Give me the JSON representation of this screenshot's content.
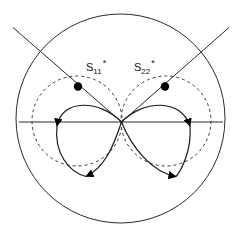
{
  "figure": {
    "name": "smith-chart-stability-diagram",
    "background_color": "#ffffff",
    "stroke_color": "#1a1a1a",
    "marker_color": "#000000",
    "width": 241,
    "height": 241
  },
  "outer_circle": {
    "name": "unit-circle",
    "cx": 120.5,
    "cy": 118.5,
    "r": 104.5,
    "style": "solid"
  },
  "center_point": {
    "x": 121.5,
    "y": 122.0
  },
  "horizontal_axis": {
    "name": "real-axis",
    "x1": 19.0,
    "y1": 122.0,
    "x2": 223.0,
    "y2": 122.0,
    "style": "solid"
  },
  "diagonals": [
    {
      "name": "left-diagonal",
      "x1": 13.0,
      "y1": 27.5,
      "x2": 121.5,
      "y2": 122.0
    },
    {
      "name": "right-diagonal",
      "x1": 229.0,
      "y1": 27.5,
      "x2": 121.5,
      "y2": 122.0
    }
  ],
  "dashed_circles": [
    {
      "name": "left-dashed-circle",
      "cx": 77.0,
      "cy": 121.0,
      "r": 45.0,
      "style": "dashed",
      "dash_pattern": "3,3"
    },
    {
      "name": "right-dashed-circle",
      "cx": 166.0,
      "cy": 121.0,
      "r": 45.0,
      "style": "dashed",
      "dash_pattern": "3,3"
    }
  ],
  "loops": [
    {
      "name": "left-loop",
      "direction": "counterclockwise",
      "outer_extent_x": 57.0,
      "bottom_y": 176.0
    },
    {
      "name": "right-loop",
      "direction": "clockwise",
      "outer_extent_x": 186.0,
      "bottom_y": 176.0
    }
  ],
  "arrowheads": [
    {
      "name": "left-loop-up-arrow",
      "x": 57.0,
      "y": 126.0,
      "rotation": -90
    },
    {
      "name": "left-loop-bottom-arrow",
      "x": 85.0,
      "y": 176.5,
      "rotation": 200
    },
    {
      "name": "right-loop-up-arrow",
      "x": 190.0,
      "y": 126.0,
      "rotation": -90
    },
    {
      "name": "right-loop-bottom-arrow",
      "x": 178.0,
      "y": 176.5,
      "rotation": -20
    }
  ],
  "markers": [
    {
      "name": "s11-conjugate-marker",
      "x": 78.0,
      "y": 86.5,
      "r": 4.2,
      "label": {
        "base": "S",
        "subscript": "11",
        "superscript": "*",
        "text": "S11*",
        "anchor_x": 86.0,
        "anchor_y": 68.0
      }
    },
    {
      "name": "s22-conjugate-marker",
      "x": 165.0,
      "y": 86.5,
      "r": 4.2,
      "label": {
        "base": "S",
        "subscript": "22",
        "superscript": "*",
        "text": "S22*",
        "anchor_x": 134.0,
        "anchor_y": 68.0
      }
    }
  ]
}
